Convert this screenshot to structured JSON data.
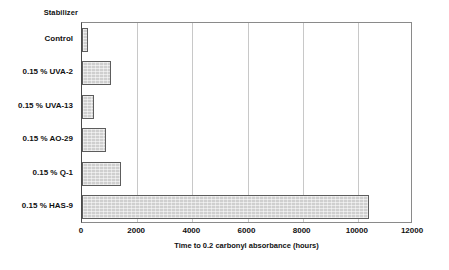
{
  "chart_data": {
    "type": "bar",
    "orientation": "horizontal",
    "title": "",
    "xlabel": "Time to 0.2 carbonyl absorbance (hours)",
    "ylabel": "Stabilizer",
    "categories": [
      "Control",
      "0.15 % UVA-2",
      "0.15 % UVA-13",
      "0.15 % AO-29",
      "0.15 % Q-1",
      "0.15 % HAS-9"
    ],
    "values": [
      220,
      1050,
      430,
      870,
      1420,
      10400
    ],
    "xlim": [
      0,
      12000
    ],
    "xticks": [
      0,
      2000,
      4000,
      6000,
      8000,
      10000,
      12000
    ],
    "xtick_labels": [
      "0",
      "2000",
      "4000",
      "6000",
      "8000",
      "10000",
      "12000"
    ],
    "grid": "vertical",
    "legend": "none",
    "bar_fill_color": "#cfcfcf",
    "bar_edge_color": "#5d5d5d",
    "gridline_color": "#c8c8c8",
    "frame_color": "#8a8a8a",
    "background_color": "#ffffff"
  }
}
